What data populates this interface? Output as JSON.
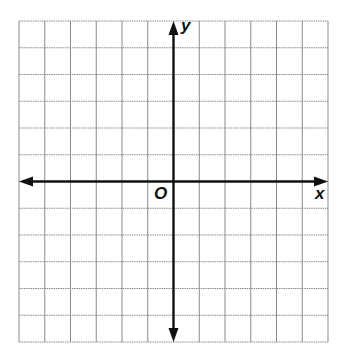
{
  "diagram": {
    "type": "coordinate-plane",
    "grid": {
      "columns": 12,
      "rows": 12,
      "left": 19,
      "top": 21,
      "right": 328,
      "bottom": 342,
      "line_color": "#8a8a8a",
      "line_style": "dotted"
    },
    "axes": {
      "origin_col": 6,
      "origin_row": 6,
      "color": "#111111",
      "x_label": "x",
      "y_label": "y",
      "origin_label": "O",
      "arrows": [
        "left",
        "right",
        "up",
        "down"
      ]
    }
  }
}
